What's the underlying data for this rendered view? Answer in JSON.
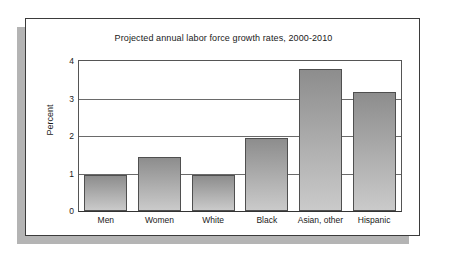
{
  "figure": {
    "title": "Projected annual labor force growth rates, 2000-2010",
    "y_axis_title": "Percent",
    "panel_border_color": "#3b3b3b",
    "shadow_color": "#b4b4b4",
    "bar_fill_top": "#8d8d8d",
    "bar_fill_bottom": "#cacaca",
    "bar_edge_color": "#4f4f4f",
    "gridline_color": "#6a6a6a"
  },
  "chart_data": {
    "type": "bar",
    "title": "Projected annual labor force growth rates, 2000-2010",
    "xlabel": "",
    "ylabel": "Percent",
    "categories": [
      "Men",
      "Women",
      "White",
      "Black",
      "Asian, other",
      "Hispanic"
    ],
    "values": [
      0.95,
      1.45,
      0.95,
      1.95,
      3.8,
      3.17
    ],
    "ylim": [
      0,
      4
    ],
    "yticks": [
      0,
      1,
      2,
      3,
      4
    ],
    "ytick_labels": [
      "0",
      "1",
      "2",
      "3",
      "4"
    ],
    "grid": true,
    "grid_axis": "y",
    "legend": false,
    "legend_position": "none",
    "series": [
      {
        "name": "Projected annual growth rate",
        "values": [
          0.95,
          1.45,
          0.95,
          1.95,
          3.8,
          3.17
        ]
      }
    ]
  }
}
